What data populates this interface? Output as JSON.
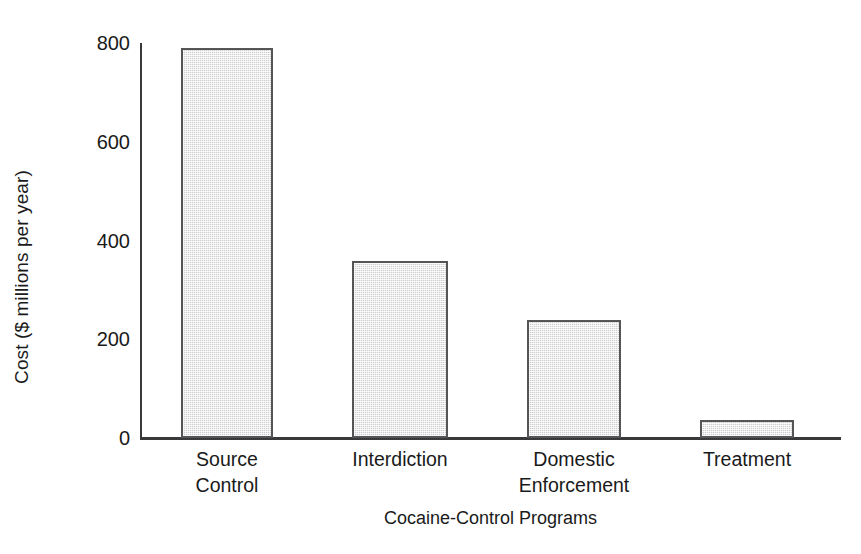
{
  "chart_data": {
    "type": "bar",
    "title": "",
    "subtitle": "",
    "xlabel": "Cocaine-Control Programs",
    "ylabel": "Cost ($ millions per year)",
    "categories": [
      "Source Control",
      "Interdiction",
      "Domestic Enforcement",
      "Treatment"
    ],
    "category_lines": [
      [
        "Source",
        "Control"
      ],
      [
        "Interdiction"
      ],
      [
        "Domestic",
        "Enforcement"
      ],
      [
        "Treatment"
      ]
    ],
    "values": [
      790,
      358,
      239,
      36
    ],
    "ylim": [
      0,
      800
    ],
    "yticks": [
      0,
      200,
      400,
      600,
      800
    ],
    "ytick_labels": [
      "0",
      "200",
      "400",
      "600",
      "800"
    ],
    "grid": false,
    "legend": null,
    "legend_position": "none",
    "bar_fill_color": "#d9d9d9",
    "bar_edge_color": "#555558",
    "axis_color": "#39393b",
    "background_color": "#ffffff",
    "text_color": "#1a1a1a"
  }
}
